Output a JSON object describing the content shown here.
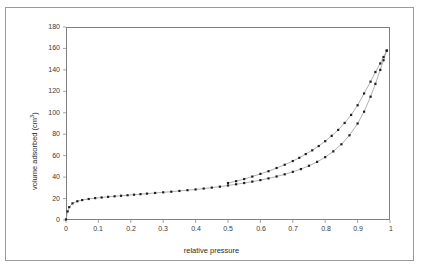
{
  "figure": {
    "background_color": "#ffffff",
    "border_color": "#9a9a9a",
    "axis_color": "#808080",
    "line_color": "#8f8f8f",
    "marker_color": "#1f1f1f"
  },
  "axis_titles": {
    "x": "relative pressure",
    "y_prefix": "volume adsorbed (cm",
    "y_superscript": "3",
    "y_suffix": ")"
  },
  "ticks": {
    "x": [
      "0",
      "0.1",
      "0.2",
      "0.3",
      "0.4",
      "0.5",
      "0.6",
      "0.7",
      "0.8",
      "0.9",
      "1"
    ],
    "y": [
      "0",
      "20",
      "40",
      "60",
      "80",
      "100",
      "120",
      "140",
      "160",
      "180"
    ]
  },
  "chart_data": {
    "type": "line",
    "title": "",
    "subtitle": "",
    "xlabel": "relative pressure",
    "ylabel": "volume adsorbed (cm3)",
    "xlim": [
      0,
      1
    ],
    "ylim": [
      0,
      180
    ],
    "xticks": [
      0,
      0.1,
      0.2,
      0.3,
      0.4,
      0.5,
      0.6,
      0.7,
      0.8,
      0.9,
      1
    ],
    "yticks": [
      0,
      20,
      40,
      60,
      80,
      100,
      120,
      140,
      160,
      180
    ],
    "grid": false,
    "legend": "none",
    "markers": "small filled squares",
    "annotations": [],
    "series": [
      {
        "name": "adsorption",
        "x": [
          0.0,
          0.005,
          0.01,
          0.02,
          0.035,
          0.05,
          0.07,
          0.09,
          0.11,
          0.13,
          0.15,
          0.17,
          0.19,
          0.21,
          0.23,
          0.25,
          0.275,
          0.3,
          0.325,
          0.35,
          0.375,
          0.4,
          0.425,
          0.45,
          0.475,
          0.5,
          0.525,
          0.55,
          0.575,
          0.6,
          0.625,
          0.65,
          0.675,
          0.7,
          0.725,
          0.75,
          0.775,
          0.8,
          0.825,
          0.85,
          0.875,
          0.9,
          0.92,
          0.94,
          0.955,
          0.97,
          0.98,
          0.99
        ],
        "y": [
          0.5,
          8.0,
          12.0,
          15.5,
          17.5,
          18.6,
          19.6,
          20.4,
          21.0,
          21.6,
          22.1,
          22.6,
          23.1,
          23.6,
          24.1,
          24.6,
          25.2,
          25.8,
          26.4,
          27.1,
          27.8,
          28.5,
          29.3,
          30.2,
          31.1,
          32.2,
          33.3,
          34.5,
          35.8,
          37.2,
          38.8,
          40.6,
          42.6,
          44.9,
          47.5,
          50.6,
          54.2,
          58.6,
          64.0,
          70.6,
          79.0,
          90.0,
          101.0,
          115.0,
          127.0,
          140.0,
          149.0,
          158.0
        ]
      },
      {
        "name": "desorption",
        "x": [
          0.99,
          0.98,
          0.97,
          0.955,
          0.94,
          0.92,
          0.9,
          0.88,
          0.86,
          0.84,
          0.82,
          0.8,
          0.78,
          0.76,
          0.74,
          0.72,
          0.7,
          0.675,
          0.65,
          0.625,
          0.6,
          0.575,
          0.55,
          0.525,
          0.5
        ],
        "y": [
          158.0,
          152.0,
          146.0,
          138.0,
          129.0,
          118.0,
          107.0,
          98.0,
          90.5,
          84.0,
          78.5,
          73.5,
          69.0,
          65.0,
          61.5,
          58.0,
          55.0,
          51.5,
          48.5,
          45.5,
          43.0,
          40.5,
          38.2,
          36.2,
          34.5
        ]
      }
    ]
  }
}
